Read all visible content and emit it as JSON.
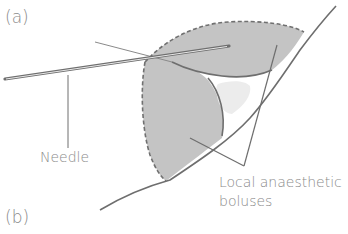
{
  "panels": {
    "a_label": "(a)",
    "b_label": "(b)"
  },
  "labels": {
    "needle": "Needle",
    "local_anaesthetic_line1": "Local anaesthetic",
    "local_anaesthetic_line2": "boluses"
  },
  "colors": {
    "fill_gray": "#c4c4c4",
    "line_dark": "#6e6e6e",
    "line_light": "#9a9a9a",
    "blob_light": "#ececec",
    "text": "#8a8a8a"
  }
}
